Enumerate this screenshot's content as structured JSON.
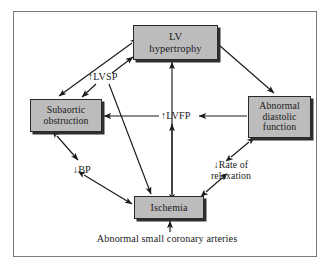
{
  "diagram": {
    "frame_color": "#7a7a7a",
    "node_fill": "#bcbcbc",
    "node_border": "#2a2a2a",
    "arrow_color": "#1a1a1a",
    "nodes": [
      {
        "id": "lv-hypertrophy",
        "label": "LV\nhypertrophy"
      },
      {
        "id": "subaortic-obstruction",
        "label": "Subaortic\nobstruction"
      },
      {
        "id": "abnormal-diastolic-function",
        "label": "Abnormal\ndiastolic\nfunction"
      },
      {
        "id": "ischemia",
        "label": "Ischemia"
      }
    ],
    "labels": [
      {
        "id": "lvsp",
        "text": "↑LVSP"
      },
      {
        "id": "lvfp",
        "text": "↑LVFP"
      },
      {
        "id": "bp",
        "text": "↓BP"
      },
      {
        "id": "rate-of-relaxation",
        "text": "↓Rate of\nrelaxation"
      },
      {
        "id": "coronary-arteries",
        "text": "Abnormal small coronary arteries"
      }
    ],
    "edges": [
      {
        "from": "lv-hypertrophy",
        "to": "subaortic-obstruction",
        "heads": "double"
      },
      {
        "from": "lv-hypertrophy",
        "to": "abnormal-diastolic-function",
        "heads": "single"
      },
      {
        "from": "lvsp",
        "to": "lv-hypertrophy",
        "heads": "single"
      },
      {
        "from": "lvsp",
        "to": "subaortic-obstruction",
        "heads": "single"
      },
      {
        "from": "lvsp",
        "to": "ischemia",
        "heads": "single"
      },
      {
        "from": "ischemia",
        "to": "lv-hypertrophy",
        "heads": "single"
      },
      {
        "from": "abnormal-diastolic-function",
        "to": "lvfp",
        "heads": "single"
      },
      {
        "from": "lvfp",
        "to": "subaortic-obstruction",
        "heads": "single"
      },
      {
        "from": "lvfp",
        "to": "ischemia",
        "heads": "double"
      },
      {
        "from": "subaortic-obstruction",
        "to": "bp",
        "heads": "double"
      },
      {
        "from": "bp",
        "to": "ischemia",
        "heads": "double"
      },
      {
        "from": "abnormal-diastolic-function",
        "to": "rate-of-relaxation",
        "heads": "double"
      },
      {
        "from": "rate-of-relaxation",
        "to": "ischemia",
        "heads": "double"
      },
      {
        "from": "coronary-arteries",
        "to": "ischemia",
        "heads": "single"
      }
    ]
  }
}
